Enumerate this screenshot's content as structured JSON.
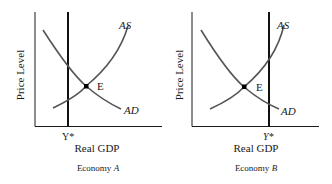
{
  "panels": [
    {
      "id": "A",
      "y_axis_label": "Price Level",
      "x_axis_label": "Real GDP",
      "caption_prefix": "Economy ",
      "caption_letter": "A",
      "curve_as_label": "AS",
      "curve_ad_label": "AD",
      "equilibrium_label": "E",
      "potential_output_label": "Y*",
      "potential_output_position": "left of equilibrium"
    },
    {
      "id": "B",
      "y_axis_label": "Price Level",
      "x_axis_label": "Real GDP",
      "caption_prefix": "Economy ",
      "caption_letter": "B",
      "curve_as_label": "AS",
      "curve_ad_label": "AD",
      "equilibrium_label": "E",
      "potential_output_label": "Y*",
      "potential_output_position": "right of equilibrium"
    }
  ],
  "colors": {
    "axes": "#1a1a1a",
    "curves": "#555555",
    "potential_output_line": "#111111",
    "equilibrium_point": "#000000"
  }
}
